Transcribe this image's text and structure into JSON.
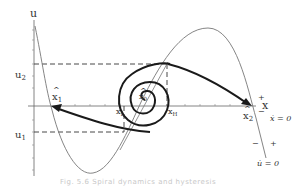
{
  "diagram": {
    "axes": {
      "y_label": "u",
      "x_label": "x"
    },
    "y_levels": {
      "u2": {
        "label": "u",
        "sub": "2"
      },
      "u1": {
        "label": "u",
        "sub": "1"
      }
    },
    "points": {
      "x_hat_1": {
        "label": "x",
        "sub": "1"
      },
      "x_hat_0": {
        "label": "x",
        "sub": "0"
      },
      "x_hat_2": {
        "label": "x",
        "sub": "2"
      },
      "x_L": {
        "label": "x",
        "sub": "L"
      },
      "x_H": {
        "label": "x",
        "sub": "H"
      }
    },
    "nullclines": {
      "x_dot": {
        "label": "ẋ = 0",
        "plus": "+",
        "minus": "−"
      },
      "u_dot": {
        "label": "u̇ = 0",
        "plus": "+",
        "minus": "−"
      }
    },
    "caption": "Fig. 5.6   Spiral dynamics and hysteresis"
  },
  "colors": {
    "curve": "#777777",
    "trajectory": "#1a1a1a",
    "axis": "#666666",
    "dashed": "#333333"
  }
}
